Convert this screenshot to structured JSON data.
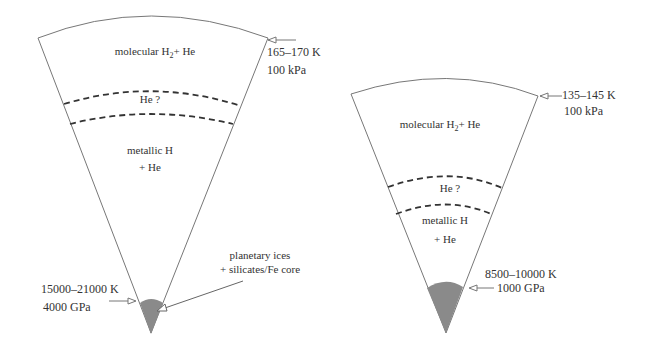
{
  "diagrams": [
    {
      "planet": "left",
      "layers": {
        "outer": "molecular H",
        "outer_sub": "2",
        "outer_tail": "+ He",
        "transition": "He ?",
        "metallic_line1": "metallic H",
        "metallic_line2": "+ He"
      },
      "surface": {
        "temp": "165–170 K",
        "pressure": "100 kPa"
      },
      "core_boundary": {
        "temp": "15000–21000 K",
        "pressure": "4000 GPa"
      },
      "core": {
        "line1": "planetary ices",
        "line2": "+ silicates/Fe core"
      }
    },
    {
      "planet": "right",
      "layers": {
        "outer": "molecular H",
        "outer_sub": "2",
        "outer_tail": "+ He",
        "transition": "He ?",
        "metallic_line1": "metallic H",
        "metallic_line2": "+ He"
      },
      "surface": {
        "temp": "135–145 K",
        "pressure": "100 kPa"
      },
      "core_boundary": {
        "temp": "8500–10000 K",
        "pressure": "1000 GPa"
      }
    }
  ],
  "colors": {
    "line": "#777777",
    "dash": "#333333",
    "core": "#8a8a8a"
  }
}
